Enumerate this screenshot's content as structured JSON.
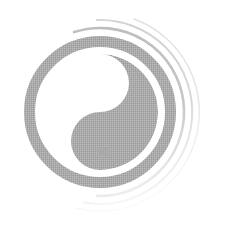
{
  "image": {
    "width": 225,
    "height": 229,
    "background_color": "#ffffff",
    "subject_name": "yin-yang-symbol",
    "caption": "Taijitu (yin and yang) symbol drawn in gray with decorative brush arcs",
    "style": "halftone dithered gray brush illustration"
  },
  "colors": {
    "ink": "#a9a9a9",
    "ink_dark": "#9c9c9c",
    "ink_mid": "#b4b4b4",
    "arc_1": "#bdbdbd",
    "arc_2": "#d2d2d2",
    "arc_3": "#e2e2e2",
    "paper": "#ffffff"
  },
  "symbol": {
    "name": "taijitu",
    "center_x": 100,
    "center_y": 112,
    "outer_radius": 76,
    "ring_thickness": 11,
    "inner_radius": 58,
    "dark_half_label": "yang-lobe",
    "light_half_label": "yin-lobe",
    "dark_half_color": "#a9a9a9",
    "light_half_color": "#ffffff"
  },
  "dots": [
    {
      "name": "yang-eye-dot",
      "cx": 105,
      "cy": 86,
      "r": 5,
      "color": "#ffffff"
    },
    {
      "name": "yin-eye-dot",
      "cx": 104,
      "cy": 152,
      "r": 4.5,
      "color": "#a9a9a9"
    }
  ],
  "decorative_arcs": [
    {
      "name": "brush-arc-outer-1",
      "radius": 84,
      "stroke_width": 2.6,
      "color": "#bdbdbd",
      "start_angle": -108,
      "end_angle": 92
    },
    {
      "name": "brush-arc-outer-2",
      "radius": 92,
      "stroke_width": 2.0,
      "color": "#d2d2d2",
      "start_angle": -92,
      "end_angle": 100
    },
    {
      "name": "brush-arc-outer-3",
      "radius": 99,
      "stroke_width": 1.5,
      "color": "#e2e2e2",
      "start_angle": -70,
      "end_angle": 104
    }
  ]
}
